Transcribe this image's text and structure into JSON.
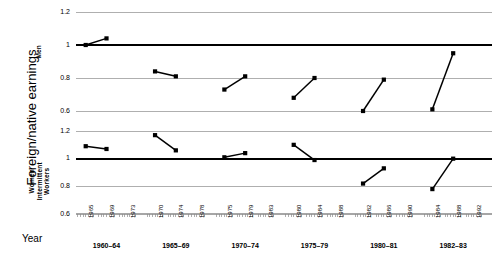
{
  "axis": {
    "y_title": "Foreign/native earnings",
    "x_title": "Year",
    "y_ticks": [
      "1.2",
      "1",
      "0.8",
      "0.6"
    ],
    "y_min": 0.6,
    "y_max": 1.2
  },
  "panels": [
    {
      "id": "men",
      "label_lines": [
        "Men"
      ]
    },
    {
      "id": "women",
      "label_lines": [
        "Women",
        "Intermittent",
        "Workers"
      ]
    }
  ],
  "groups": [
    {
      "label": "1960–64",
      "years": [
        "1965",
        "1969",
        "1973"
      ]
    },
    {
      "label": "1965–69",
      "years": [
        "1970",
        "1974",
        "1978"
      ]
    },
    {
      "label": "1970–74",
      "years": [
        "1975",
        "1979",
        "1983"
      ]
    },
    {
      "label": "1975–79",
      "years": [
        "1980",
        "1984",
        "1988"
      ]
    },
    {
      "label": "1980–81",
      "years": [
        "1982",
        "1986",
        "1990"
      ]
    },
    {
      "label": "1982–83",
      "years": [
        "1984",
        "1988",
        "1992"
      ]
    }
  ],
  "chart_data": {
    "type": "line",
    "title": "",
    "xlabel": "Year",
    "ylabel": "Foreign/native earnings",
    "ylim": [
      0.6,
      1.2
    ],
    "yticks": [
      0.6,
      0.8,
      1.0,
      1.2
    ],
    "grid": true,
    "reference_line": 1.0,
    "legend": "none",
    "panels": [
      {
        "name": "Men",
        "series": [
          {
            "name": "1960–64",
            "x": [
              "1965",
              "1969"
            ],
            "values": [
              1.0,
              1.04
            ]
          },
          {
            "name": "1965–69",
            "x": [
              "1970",
              "1974"
            ],
            "values": [
              0.84,
              0.81
            ]
          },
          {
            "name": "1970–74",
            "x": [
              "1975",
              "1979"
            ],
            "values": [
              0.73,
              0.81
            ]
          },
          {
            "name": "1975–79",
            "x": [
              "1980",
              "1984"
            ],
            "values": [
              0.68,
              0.8
            ]
          },
          {
            "name": "1980–81",
            "x": [
              "1982",
              "1986"
            ],
            "values": [
              0.6,
              0.79
            ]
          },
          {
            "name": "1982–83",
            "x": [
              "1984",
              "1988"
            ],
            "values": [
              0.61,
              0.95
            ]
          }
        ]
      },
      {
        "name": "Women Intermittent Workers",
        "series": [
          {
            "name": "1960–64",
            "x": [
              "1965",
              "1969"
            ],
            "values": [
              1.09,
              1.07
            ]
          },
          {
            "name": "1965–69",
            "x": [
              "1970",
              "1974"
            ],
            "values": [
              1.17,
              1.06
            ]
          },
          {
            "name": "1970–74",
            "x": [
              "1975",
              "1979"
            ],
            "values": [
              1.01,
              1.04
            ]
          },
          {
            "name": "1975–79",
            "x": [
              "1980",
              "1984"
            ],
            "values": [
              1.1,
              0.99
            ]
          },
          {
            "name": "1980–81",
            "x": [
              "1982",
              "1986"
            ],
            "values": [
              0.82,
              0.93
            ]
          },
          {
            "name": "1982–83",
            "x": [
              "1984",
              "1988"
            ],
            "values": [
              0.78,
              1.0
            ]
          }
        ]
      }
    ]
  }
}
